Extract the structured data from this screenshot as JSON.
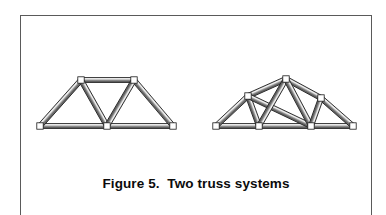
{
  "figure": {
    "caption": "Figure 5.  Two truss systems",
    "caption_label": "Figure 5.",
    "caption_title": "Two truss systems",
    "frame_color": "#5a5a5a",
    "background_color": "#ffffff",
    "member_outline_color": "#1a1a1a",
    "member_fill_light": "#d9d9d9",
    "member_fill_dark": "#6e6e6e",
    "node_fill_color": "#ffffff"
  },
  "trusses": [
    {
      "name": "trapezoidal-truss",
      "label": "Trapezoidal (Pratt-type) truss",
      "nodes": [
        {
          "id": "L0",
          "x": 20,
          "y": 111
        },
        {
          "id": "L1",
          "x": 87,
          "y": 111
        },
        {
          "id": "L2",
          "x": 153,
          "y": 111
        },
        {
          "id": "U1",
          "x": 61,
          "y": 65
        },
        {
          "id": "U2",
          "x": 114,
          "y": 65
        }
      ],
      "members": [
        {
          "from": "L0",
          "to": "L1"
        },
        {
          "from": "L1",
          "to": "L2"
        },
        {
          "from": "L0",
          "to": "U1"
        },
        {
          "from": "U1",
          "to": "U2"
        },
        {
          "from": "U2",
          "to": "L2"
        },
        {
          "from": "U1",
          "to": "L1"
        },
        {
          "from": "U2",
          "to": "L1"
        }
      ]
    },
    {
      "name": "cambered-polygonal-truss",
      "label": "Cambered polygonal truss",
      "nodes": [
        {
          "id": "R0",
          "x": 196,
          "y": 111
        },
        {
          "id": "R1",
          "x": 239,
          "y": 111
        },
        {
          "id": "R2",
          "x": 291,
          "y": 111
        },
        {
          "id": "R3",
          "x": 333,
          "y": 111
        },
        {
          "id": "T1",
          "x": 228,
          "y": 81
        },
        {
          "id": "T2",
          "x": 266,
          "y": 64
        },
        {
          "id": "T3",
          "x": 301,
          "y": 83
        }
      ],
      "members": [
        {
          "from": "R0",
          "to": "R1"
        },
        {
          "from": "R1",
          "to": "R2"
        },
        {
          "from": "R2",
          "to": "R3"
        },
        {
          "from": "R0",
          "to": "T1"
        },
        {
          "from": "T1",
          "to": "T2"
        },
        {
          "from": "T2",
          "to": "T3"
        },
        {
          "from": "T3",
          "to": "R3"
        },
        {
          "from": "T1",
          "to": "R1"
        },
        {
          "from": "T1",
          "to": "R2"
        },
        {
          "from": "T2",
          "to": "R1"
        },
        {
          "from": "T2",
          "to": "R2"
        },
        {
          "from": "T3",
          "to": "R2"
        }
      ]
    }
  ]
}
